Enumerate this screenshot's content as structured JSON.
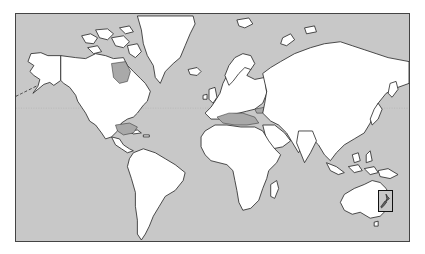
{
  "map": {
    "type": "world-outline-map",
    "projection": "Mercator",
    "colors": {
      "ocean": "#c8c8c8",
      "land": "#ffffff",
      "outline": "#222222",
      "inland_seas": "#a9a9a9",
      "frame": "#444444"
    },
    "continents": [
      "North America",
      "South America",
      "Europe",
      "Africa",
      "Asia",
      "Australia",
      "Greenland"
    ],
    "highlighted_region": {
      "name": "New Zealand",
      "style": "boxed inset"
    },
    "features": [
      "international-date-line-dashed",
      "equator-dotted"
    ]
  }
}
